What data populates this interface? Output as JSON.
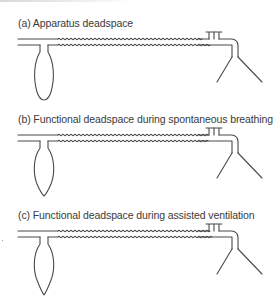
{
  "figure": {
    "panels": [
      {
        "id": "a",
        "label": "(a) Apparatus deadspace",
        "bag_shape": "rounded"
      },
      {
        "id": "b",
        "label": "(b) Functional deadspace during spontaneous breathing",
        "bag_shape": "pointed"
      },
      {
        "id": "c",
        "label": "(c) Functional deadspace during assisted ventilation",
        "bag_shape": "pointed"
      }
    ],
    "components": [
      "fresh-gas-inlet-tube",
      "reservoir-bag",
      "corrugated-tubing",
      "expiratory-valve",
      "elbow-connector",
      "face-mask"
    ],
    "colors": {
      "line": "#4a4a4a",
      "text": "#3a3a3a",
      "background": "#ffffff"
    }
  }
}
